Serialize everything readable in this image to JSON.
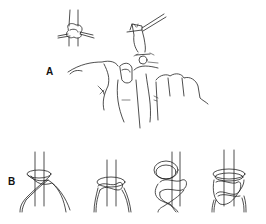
{
  "figure": {
    "panels": [
      {
        "id": "A",
        "label": "A",
        "content": "hand-tying-knot-with-needle-holder",
        "inset": "completed-knot-around-post"
      },
      {
        "id": "B",
        "label": "B",
        "steps": [
          {
            "step": 1,
            "content": "strands-crossed-loop"
          },
          {
            "step": 2,
            "content": "first-throw-square-knot"
          },
          {
            "step": 3,
            "content": "second-loop-forming"
          },
          {
            "step": 4,
            "content": "completed-knot"
          }
        ]
      }
    ],
    "colors": {
      "background": "#ffffff",
      "line": "#222222"
    }
  }
}
